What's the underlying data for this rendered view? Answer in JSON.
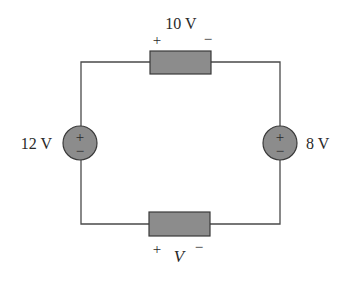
{
  "diagram": {
    "type": "circuit",
    "colors": {
      "wire": "#4a4a4a",
      "component_fill": "#8c8c8c",
      "component_stroke": "#3a3a3a",
      "text": "#2a2a2a"
    },
    "sources": [
      {
        "id": "left-source",
        "label": "12 V",
        "top_sign": "+",
        "bottom_sign": "−"
      },
      {
        "id": "right-source",
        "label": "8 V",
        "top_sign": "+",
        "bottom_sign": "−"
      }
    ],
    "resistors": [
      {
        "id": "top-resistor",
        "voltage_label": "10 V",
        "plus": "+",
        "minus": "−"
      },
      {
        "id": "bottom-resistor",
        "voltage_label": "V",
        "plus": "+",
        "minus": "−"
      }
    ]
  }
}
